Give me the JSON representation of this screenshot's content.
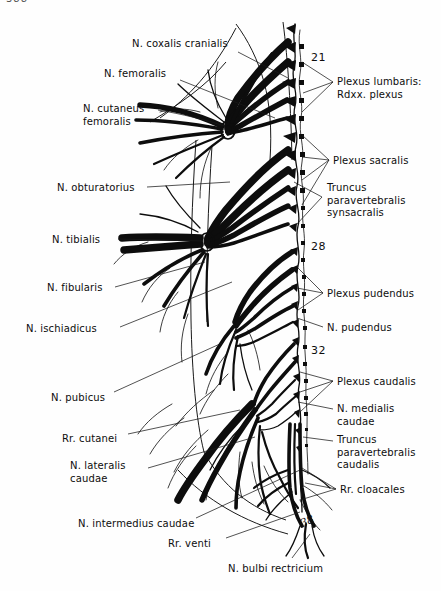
{
  "page": {
    "number_fragment": "388",
    "width": 441,
    "height": 591,
    "background": "#fefefe",
    "ink": "#0d0d0d"
  },
  "figure": {
    "type": "anatomical-line-drawing"
  },
  "labels_left": [
    {
      "id": "n-coxalis-cranialis",
      "text": "N. coxalis cranialis",
      "x": 132,
      "y": 38,
      "leader": [
        [
          238,
          52
        ],
        [
          288,
          78
        ]
      ]
    },
    {
      "id": "n-femoralis",
      "text": "N. femoralis",
      "x": 104,
      "y": 68,
      "leader": [
        [
          180,
          80
        ],
        [
          275,
          118
        ]
      ]
    },
    {
      "id": "n-cutaneus-femoralis",
      "text": "N. cutaneus\nfemoralis",
      "x": 83,
      "y": 103,
      "leader": [
        [
          158,
          110
        ],
        [
          225,
          126
        ]
      ]
    },
    {
      "id": "n-obturatorius",
      "text": "N. obturatorius",
      "x": 57,
      "y": 182,
      "leader": [
        [
          147,
          187
        ],
        [
          230,
          182
        ]
      ]
    },
    {
      "id": "n-tibialis",
      "text": "N. tibialis",
      "x": 52,
      "y": 234,
      "leader": [
        [
          118,
          239
        ],
        [
          205,
          241
        ]
      ]
    },
    {
      "id": "n-fibularis",
      "text": "N. fibularis",
      "x": 47,
      "y": 282,
      "leader": [
        [
          115,
          287
        ],
        [
          205,
          262
        ]
      ]
    },
    {
      "id": "n-ischiadicus",
      "text": "N. ischiadicus",
      "x": 26,
      "y": 323,
      "leader": [
        [
          120,
          327
        ],
        [
          232,
          282
        ]
      ]
    },
    {
      "id": "n-pubicus",
      "text": "N. pubicus",
      "x": 51,
      "y": 392,
      "leader": [
        [
          114,
          392
        ],
        [
          222,
          343
        ]
      ]
    },
    {
      "id": "rr-cutanei",
      "text": "Rr. cutanei",
      "x": 62,
      "y": 433,
      "leader": [
        [
          128,
          434
        ],
        [
          240,
          410
        ]
      ]
    },
    {
      "id": "n-lateralis-caudae",
      "text": "N. lateralis\ncaudae",
      "x": 70,
      "y": 460,
      "leader": [
        [
          148,
          468
        ],
        [
          255,
          437
        ]
      ]
    },
    {
      "id": "n-intermedius-caudae",
      "text": "N. intermedius caudae",
      "x": 78,
      "y": 518,
      "leader": [
        [
          196,
          518
        ],
        [
          300,
          470
        ]
      ]
    },
    {
      "id": "rr-venti",
      "text": "Rr. venti",
      "x": 168,
      "y": 538,
      "leader": [
        [
          226,
          538
        ],
        [
          300,
          512
        ]
      ]
    },
    {
      "id": "n-bulbi-rectricium",
      "text": "N. bulbi rectricium",
      "x": 228,
      "y": 563,
      "leader": [
        [
          292,
          558
        ],
        [
          310,
          534
        ]
      ]
    }
  ],
  "labels_right": [
    {
      "id": "plexus-lumbaris",
      "text": "Plexus lumbaris:\nRdxx. plexus",
      "x": 337,
      "y": 76,
      "leader": [
        [
          333,
          82
        ],
        [
          303,
          93
        ]
      ]
    },
    {
      "id": "plexus-sacralis",
      "text": "Plexus sacralis",
      "x": 333,
      "y": 155,
      "leader": [
        [
          329,
          160
        ],
        [
          302,
          157
        ]
      ]
    },
    {
      "id": "truncus-paravertebralis-synsacralis",
      "text": "Truncus\nparavertebralis\nsynsacralis",
      "x": 327,
      "y": 182,
      "leader": [
        [
          322,
          197
        ],
        [
          294,
          182
        ]
      ]
    },
    {
      "id": "plexus-pudendus",
      "text": "Plexus pudendus",
      "x": 327,
      "y": 288,
      "leader": [
        [
          323,
          293
        ],
        [
          297,
          288
        ]
      ]
    },
    {
      "id": "n-pudendus",
      "text": "N. pudendus",
      "x": 327,
      "y": 322,
      "leader": [
        [
          323,
          327
        ],
        [
          297,
          318
        ]
      ]
    },
    {
      "id": "plexus-caudalis",
      "text": "Plexus caudalis",
      "x": 337,
      "y": 376,
      "leader": [
        [
          333,
          381
        ],
        [
          300,
          372
        ]
      ]
    },
    {
      "id": "n-medialis-caudae",
      "text": "N. medialis\ncaudae",
      "x": 337,
      "y": 403,
      "leader": [
        [
          333,
          409
        ],
        [
          298,
          402
        ]
      ]
    },
    {
      "id": "truncus-paravertebralis-caudalis",
      "text": "Truncus\nparavertebralis\ncaudalis",
      "x": 337,
      "y": 434,
      "leader": [
        [
          333,
          441
        ],
        [
          303,
          437
        ]
      ]
    },
    {
      "id": "rr-cloacales",
      "text": "Rr. cloacales",
      "x": 340,
      "y": 484,
      "leader": [
        [
          336,
          489
        ],
        [
          305,
          483
        ]
      ]
    }
  ],
  "segment_numbers": [
    {
      "id": "segment-21",
      "text": "21",
      "x": 311,
      "y": 51
    },
    {
      "id": "segment-28",
      "text": "28",
      "x": 311,
      "y": 240
    },
    {
      "id": "segment-32",
      "text": "32",
      "x": 311,
      "y": 344
    }
  ],
  "annotations": [
    {
      "id": "handwritten-38",
      "text": "38",
      "x": 303,
      "y": 517
    }
  ]
}
